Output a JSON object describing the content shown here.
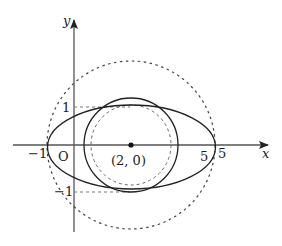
{
  "diagram": {
    "axes": {
      "x_label": "x",
      "y_label": "y",
      "origin_label": "O"
    },
    "tick_labels": {
      "x_neg1": "−1",
      "x_5_inner": "5",
      "x_5_outer": "5",
      "y_1": "1",
      "y_neg1": "−1"
    },
    "center_label": "(2, 0)",
    "shapes": [
      {
        "name": "ellipse",
        "style": "solid",
        "center": [
          2,
          0
        ],
        "semi_axes": [
          3,
          1
        ]
      },
      {
        "name": "circle-solid",
        "style": "solid",
        "center": [
          2,
          0
        ]
      },
      {
        "name": "circle-inner-dashed",
        "style": "dashed",
        "center": [
          2,
          0
        ]
      },
      {
        "name": "circle-outer-dashed",
        "style": "dashed",
        "center": [
          2,
          0
        ],
        "radius": 3
      }
    ],
    "colors": {
      "stroke": "#222222",
      "axis": "#555555",
      "dashed": "#444444"
    }
  }
}
